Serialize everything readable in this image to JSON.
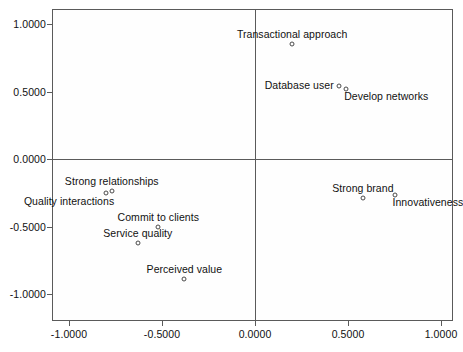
{
  "chart_data": {
    "type": "scatter",
    "title": "",
    "subtitle": "",
    "xlabel": "",
    "ylabel": "",
    "xlim": [
      -1.22,
      1.07
    ],
    "ylim": [
      -1.11,
      1.11
    ],
    "grid": false,
    "legend": "none",
    "xticks": [
      "-1.0000",
      "-0.5000",
      "0.0000",
      "0.5000",
      "1.0000"
    ],
    "xtick_values": [
      -1.0,
      -0.5,
      0.0,
      0.5,
      1.0
    ],
    "yticks": [
      "1.0000",
      "0.5000",
      "0.0000",
      "-0.5000",
      "-1.0000"
    ],
    "ytick_values": [
      1.0,
      0.5,
      0.0,
      -0.5,
      -1.0
    ],
    "reference_lines": {
      "x": 0.0,
      "y": 0.0
    },
    "points": [
      {
        "label": "Transactional approach",
        "x": 0.2,
        "y": 0.85,
        "label_position": "above-center"
      },
      {
        "label": "Database user",
        "x": 0.45,
        "y": 0.54,
        "label_position": "left"
      },
      {
        "label": "Develop networks",
        "x": 0.49,
        "y": 0.52,
        "label_position": "below-right"
      },
      {
        "label": "Strong brand",
        "x": 0.58,
        "y": -0.29,
        "label_position": "above-center"
      },
      {
        "label": "Innovativeness",
        "x": 0.75,
        "y": -0.27,
        "label_position": "below-right"
      },
      {
        "label": "Strong relationships",
        "x": -0.77,
        "y": -0.24,
        "label_position": "above-center"
      },
      {
        "label": "Quality interactions",
        "x": -0.8,
        "y": -0.25,
        "label_position": "below-left"
      },
      {
        "label": "Commit to clients",
        "x": -0.52,
        "y": -0.5,
        "label_position": "above-center"
      },
      {
        "label": "Service quality",
        "x": -0.63,
        "y": -0.62,
        "label_position": "above-center"
      },
      {
        "label": "Perceived value",
        "x": -0.38,
        "y": -0.89,
        "label_position": "above-center"
      }
    ]
  }
}
